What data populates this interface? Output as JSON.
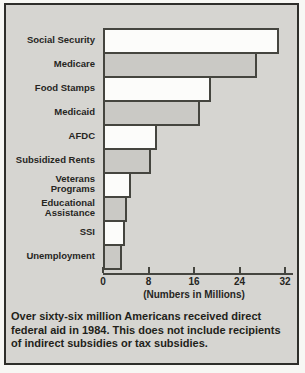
{
  "figure": {
    "kind": "scanned textbook bar chart",
    "background_color": "#d6d5d1",
    "frame_border_color": "#2e2e2a",
    "caption": "Over sixty-six million Americans received direct\nfederal aid in 1984. This does not include recipients\nof indirect subsidies or tax subsidies."
  },
  "chart_data": {
    "type": "bar",
    "orientation": "horizontal",
    "categories": [
      "Social Security",
      "Medicare",
      "Food Stamps",
      "Medicaid",
      "AFDC",
      "Subsidized Rents",
      "Veterans\nPrograms",
      "Educational\nAssistance",
      "SSI",
      "Unemployment"
    ],
    "values": [
      31,
      27,
      19,
      17,
      9.5,
      8.5,
      5,
      4.2,
      3.8,
      3.4
    ],
    "title": "",
    "xlabel": "(Numbers in Millions)",
    "ylabel": "",
    "xticks": [
      0,
      8,
      16,
      24,
      32
    ],
    "xlim": [
      0,
      32
    ],
    "grid": false,
    "legend": false,
    "bar_fill_alternation": [
      "#fcfcfa",
      "#cac9c5"
    ],
    "bar_border_color": "#45453f",
    "note": "bars alternate white / gray from top to bottom"
  }
}
